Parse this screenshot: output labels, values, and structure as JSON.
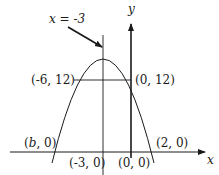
{
  "diagram": {
    "type": "parabola-graph",
    "axes": {
      "x_label": "x",
      "y_label": "y"
    },
    "symmetry_line": {
      "label": "x = -3"
    },
    "points": [
      {
        "id": "vertex-left-chord",
        "label": "(-6, 12)"
      },
      {
        "id": "y-intercept",
        "label": "(0, 12)"
      },
      {
        "id": "left-root",
        "label_prefix": "(",
        "label_var": "b",
        "label_suffix": ", 0)"
      },
      {
        "id": "right-root",
        "label": "(2, 0)"
      },
      {
        "id": "axis-foot",
        "label": "(-3, 0)"
      },
      {
        "id": "origin",
        "label": "(0, 0)"
      }
    ],
    "colors": {
      "stroke": "#1a1a1a",
      "background": "#ffffff"
    }
  }
}
